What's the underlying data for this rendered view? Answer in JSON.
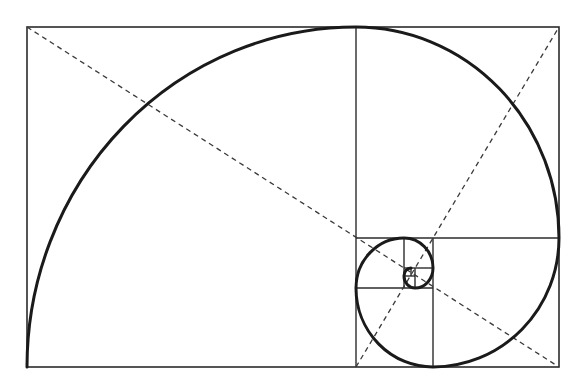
{
  "diagram": {
    "colors": {
      "background": "#ffffff",
      "line": "#2b2b2b",
      "spiral": "#1a1a1a",
      "dashed": "#3a3a3a"
    },
    "outer_rect": {
      "x": 27,
      "y": 27,
      "width": 532,
      "height": 340
    },
    "divider_lines": [
      {
        "x1": 356,
        "y1": 27,
        "x2": 356,
        "y2": 367
      },
      {
        "x1": 356,
        "y1": 238,
        "x2": 559,
        "y2": 238
      },
      {
        "x1": 433,
        "y1": 238,
        "x2": 433,
        "y2": 367
      },
      {
        "x1": 356,
        "y1": 288,
        "x2": 433,
        "y2": 288
      },
      {
        "x1": 404,
        "y1": 238,
        "x2": 404,
        "y2": 288
      },
      {
        "x1": 404,
        "y1": 268,
        "x2": 433,
        "y2": 268
      },
      {
        "x1": 415,
        "y1": 268,
        "x2": 415,
        "y2": 288
      },
      {
        "x1": 404,
        "y1": 276,
        "x2": 415,
        "y2": 276
      },
      {
        "x1": 411,
        "y1": 268,
        "x2": 411,
        "y2": 276
      }
    ],
    "diagonals": [
      {
        "x1": 27,
        "y1": 27,
        "x2": 559,
        "y2": 367
      },
      {
        "x1": 356,
        "y1": 367,
        "x2": 559,
        "y2": 27
      }
    ],
    "spiral_arcs": [
      {
        "from": [
          27,
          367
        ],
        "to": [
          356,
          27
        ],
        "rx": 329,
        "ry": 340
      },
      {
        "from": [
          356,
          27
        ],
        "to": [
          559,
          238
        ],
        "rx": 203,
        "ry": 211
      },
      {
        "from": [
          559,
          238
        ],
        "to": [
          433,
          367
        ],
        "rx": 126,
        "ry": 129
      },
      {
        "from": [
          433,
          367
        ],
        "to": [
          356,
          288
        ],
        "rx": 77,
        "ry": 79
      },
      {
        "from": [
          356,
          288
        ],
        "to": [
          404,
          238
        ],
        "rx": 48,
        "ry": 50
      },
      {
        "from": [
          404,
          238
        ],
        "to": [
          433,
          268
        ],
        "rx": 29,
        "ry": 30
      },
      {
        "from": [
          433,
          268
        ],
        "to": [
          415,
          288
        ],
        "rx": 18,
        "ry": 20
      },
      {
        "from": [
          415,
          288
        ],
        "to": [
          404,
          276
        ],
        "rx": 11,
        "ry": 12
      },
      {
        "from": [
          404,
          276
        ],
        "to": [
          411,
          268
        ],
        "rx": 7,
        "ry": 8
      }
    ]
  }
}
